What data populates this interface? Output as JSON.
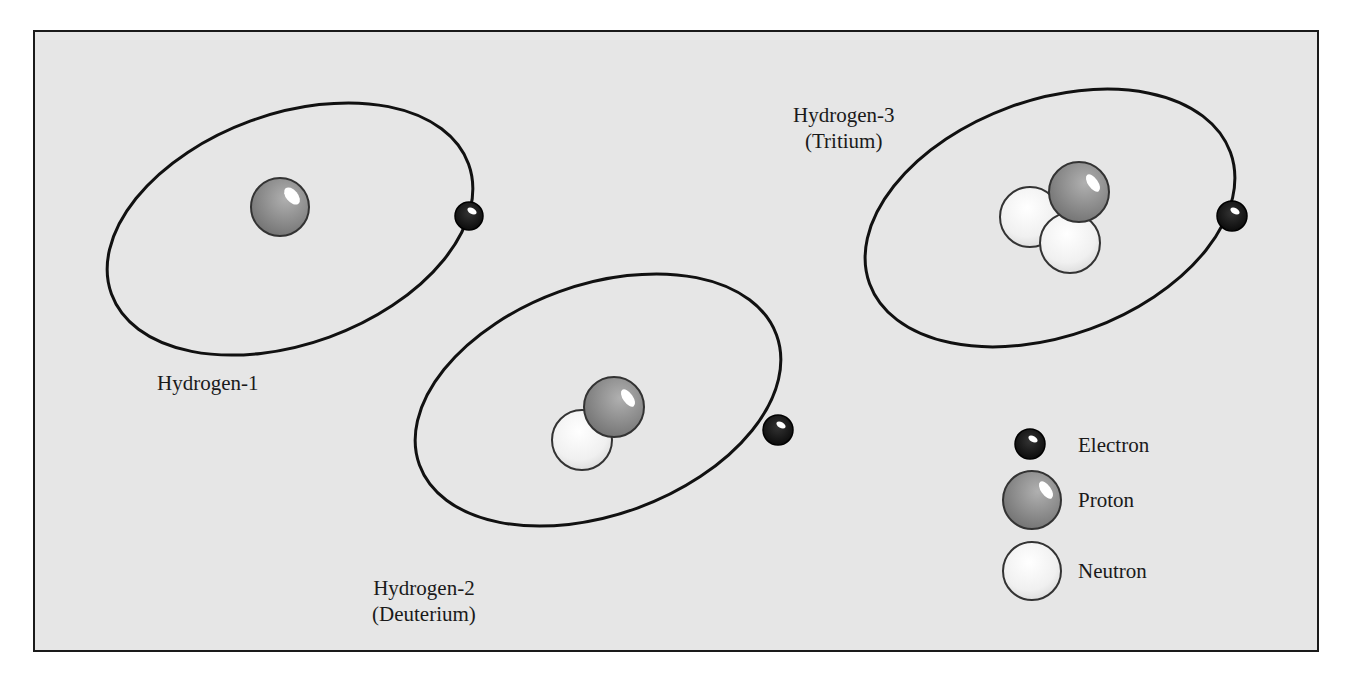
{
  "diagram": {
    "atoms": [
      {
        "id": "hydrogen-1",
        "name": "Hydrogen-1",
        "common_name": "",
        "protons": 1,
        "neutrons": 0,
        "electrons": 1
      },
      {
        "id": "hydrogen-2",
        "name": "Hydrogen-2",
        "common_name": "(Deuterium)",
        "protons": 1,
        "neutrons": 1,
        "electrons": 1
      },
      {
        "id": "hydrogen-3",
        "name": "Hydrogen-3",
        "common_name": "(Tritium)",
        "protons": 1,
        "neutrons": 2,
        "electrons": 1
      }
    ],
    "legend": {
      "items": [
        {
          "label": "Electron",
          "icon": "electron-icon",
          "color": "#111111"
        },
        {
          "label": "Proton",
          "icon": "proton-icon",
          "color": "#8a8a8a"
        },
        {
          "label": "Neutron",
          "icon": "neutron-icon",
          "color": "#f2f2f2"
        }
      ]
    },
    "colors": {
      "background": "#e6e6e6",
      "orbit": "#111111",
      "frame": "#1a1a1a"
    }
  }
}
